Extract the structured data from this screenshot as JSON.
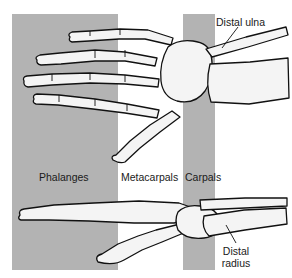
{
  "diagram": {
    "colors": {
      "background": "#ffffff",
      "shaded_band": "#b3b3b3",
      "bone_fill": "#f4f4f4",
      "outline": "#111111"
    },
    "regions": [
      {
        "id": "phalanges",
        "label": "Phalanges",
        "shaded": true
      },
      {
        "id": "metacarpals",
        "label": "Metacarpals",
        "shaded": false
      },
      {
        "id": "carpals",
        "label": "Carpals",
        "shaded": true
      }
    ],
    "annotations": [
      {
        "id": "distal-ulna",
        "label": "Distal ulna"
      },
      {
        "id": "distal-radius",
        "line1": "Distal",
        "line2": "radius"
      }
    ],
    "views": [
      "dorsal view of hand",
      "lateral view of hand"
    ]
  }
}
